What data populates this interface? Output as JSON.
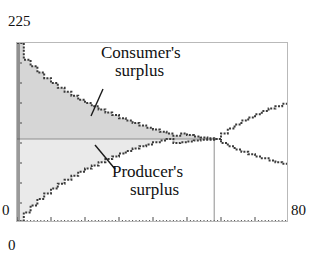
{
  "axes": {
    "y_max_label": "225",
    "y_min_label": "0",
    "x_min_label": "0",
    "x_max_label": "80"
  },
  "annotations": {
    "consumer_line1": "Consumer's",
    "consumer_line2": "surplus",
    "producer_line1": "Producer's",
    "producer_line2": "surplus"
  },
  "colors": {
    "consumer_fill": "#d6d6d6",
    "producer_fill": "#eaeaea",
    "curve": "#3a3a3a",
    "frame": "#b9b9b9",
    "axis": "#555555",
    "text": "#111111"
  },
  "chart_data": {
    "type": "area",
    "title": "",
    "xlabel": "",
    "ylabel": "",
    "xlim": [
      0,
      80
    ],
    "ylim": [
      0,
      225
    ],
    "grid": false,
    "legend": "none",
    "equilibrium": {
      "quantity": 58,
      "price": 105
    },
    "annotations": [
      {
        "text": "Consumer's surplus",
        "points_to": [
          26,
          150
        ]
      },
      {
        "text": "Producer's surplus",
        "points_to": [
          24,
          62
        ]
      }
    ],
    "series": [
      {
        "name": "Demand",
        "style": "step",
        "x": [
          0,
          2,
          4,
          6,
          8,
          10,
          12,
          14,
          16,
          18,
          20,
          22,
          24,
          26,
          28,
          30,
          32,
          34,
          36,
          38,
          40,
          42,
          44,
          46,
          48,
          50,
          52,
          54,
          56,
          58,
          60,
          62,
          64,
          66,
          68,
          70,
          72,
          74,
          76,
          78,
          80
        ],
        "values": [
          225,
          204,
          196,
          188,
          181,
          175,
          169,
          164,
          159,
          154,
          150,
          146,
          142,
          138,
          135,
          131,
          128,
          125,
          122,
          119,
          117,
          114,
          112,
          109,
          112,
          110,
          108,
          107,
          106,
          105,
          100,
          96,
          92,
          89,
          86,
          83,
          81,
          78,
          76,
          74,
          72
        ]
      },
      {
        "name": "Supply",
        "style": "step",
        "x": [
          0,
          2,
          4,
          6,
          8,
          10,
          12,
          14,
          16,
          18,
          20,
          22,
          24,
          26,
          28,
          30,
          32,
          34,
          36,
          38,
          40,
          42,
          44,
          46,
          48,
          50,
          52,
          54,
          56,
          58,
          60,
          62,
          64,
          66,
          68,
          70,
          72,
          74,
          76,
          78,
          80
        ],
        "values": [
          2,
          13,
          22,
          30,
          37,
          43,
          49,
          54,
          59,
          64,
          68,
          72,
          76,
          80,
          83,
          87,
          90,
          93,
          96,
          98,
          101,
          103,
          105,
          100,
          101,
          102,
          103,
          104,
          104,
          105,
          112,
          118,
          123,
          128,
          132,
          136,
          140,
          143,
          146,
          149,
          152
        ]
      }
    ],
    "filled_regions": [
      {
        "name": "Consumer's surplus",
        "between": [
          "Demand",
          "equilibrium price"
        ],
        "x_range": [
          0,
          58
        ],
        "color": "#d6d6d6"
      },
      {
        "name": "Producer's surplus",
        "between": [
          "equilibrium price",
          "Supply"
        ],
        "x_range": [
          0,
          58
        ],
        "color": "#eaeaea"
      }
    ]
  }
}
